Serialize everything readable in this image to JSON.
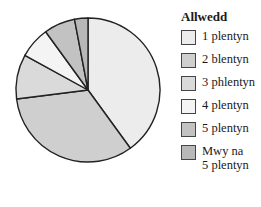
{
  "chart_data": {
    "type": "pie",
    "title": "",
    "legend_title": "Allwedd",
    "legend_position": "right",
    "categories": [
      "1 plentyn",
      "2 blentyn",
      "3 phlentyn",
      "4 plentyn",
      "5 plentyn",
      "Mwy na 5 plentyn"
    ],
    "values": [
      40,
      33,
      10,
      7,
      7,
      3
    ],
    "unit": "percent (estimated)",
    "start_angle_deg": 0,
    "direction": "clockwise",
    "colors": [
      "#ececec",
      "#cfcfcf",
      "#dadada",
      "#f4f4f4",
      "#c2c2c2",
      "#b8b8b8"
    ]
  },
  "legend": {
    "title": "Allwedd",
    "items": [
      {
        "label": "1 plentyn"
      },
      {
        "label": "2 blentyn"
      },
      {
        "label": "3 phlentyn"
      },
      {
        "label": "4 plentyn"
      },
      {
        "label": "5 plentyn"
      },
      {
        "label": "Mwy na\n5 plentyn"
      }
    ]
  }
}
